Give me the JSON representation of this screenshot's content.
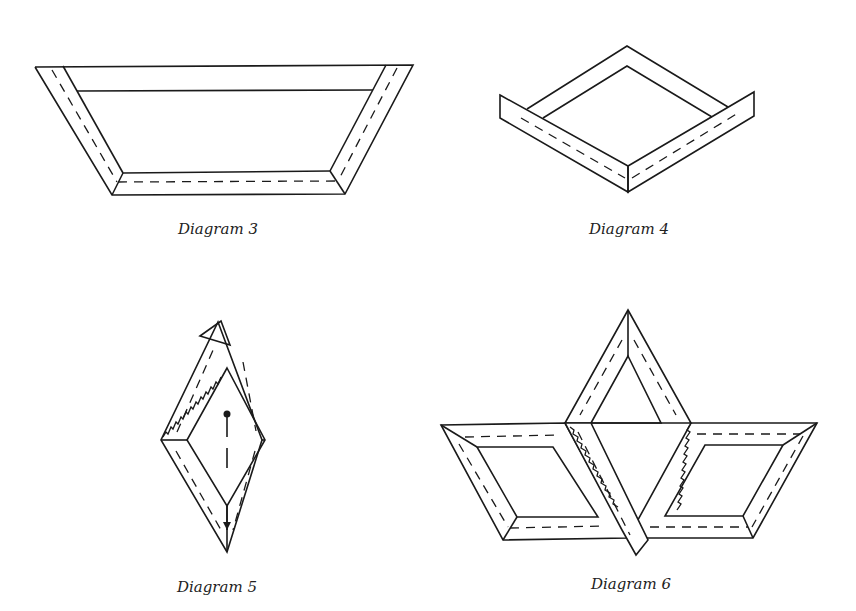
{
  "figures": [
    {
      "id": "diagram-3",
      "caption": "Diagram 3"
    },
    {
      "id": "diagram-4",
      "caption": "Diagram 4"
    },
    {
      "id": "diagram-5",
      "caption": "Diagram 5"
    },
    {
      "id": "diagram-6",
      "caption": "Diagram 6"
    }
  ],
  "colors": {
    "line": "#1a1a1a",
    "background": "#ffffff"
  }
}
